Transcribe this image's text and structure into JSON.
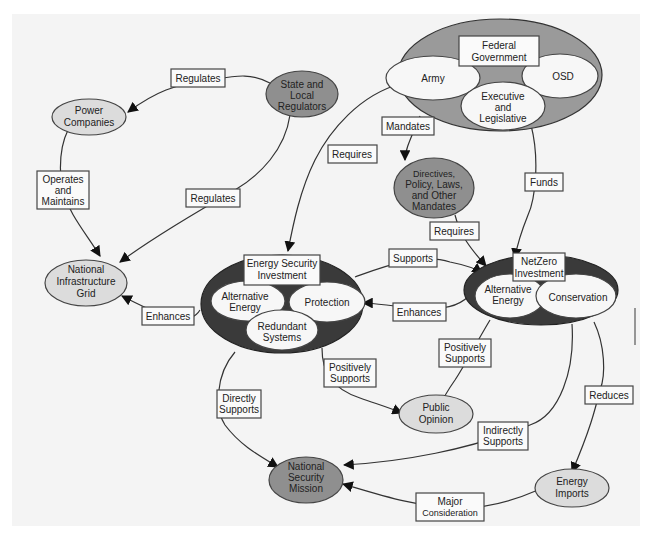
{
  "diagram": {
    "nodes": {
      "federal_government": {
        "title": [
          "Federal",
          "Government"
        ],
        "parts": {
          "army": "Army",
          "osd": "OSD",
          "exec": [
            "Executive",
            "and",
            "Legislative"
          ]
        }
      },
      "state_local_regulators": [
        "State and",
        "Local",
        "Regulators"
      ],
      "power_companies": [
        "Power",
        "Companies"
      ],
      "directives": [
        "Directives,",
        "Policy, Laws,",
        "and Other",
        "Mandates"
      ],
      "national_infrastructure_grid": [
        "National",
        "Infrastructure",
        "Grid"
      ],
      "energy_security_investment": {
        "title": [
          "Energy Security",
          "Investment"
        ],
        "parts": {
          "alt_energy": [
            "Alternative",
            "Energy"
          ],
          "protection": "Protection",
          "redundant": [
            "Redundant",
            "Systems"
          ]
        }
      },
      "netzero_investment": {
        "title": [
          "NetZero",
          "Investment"
        ],
        "parts": {
          "alt_energy": [
            "Alternative",
            "Energy"
          ],
          "conservation": "Conservation"
        }
      },
      "public_opinion": [
        "Public",
        "Opinion"
      ],
      "national_security_mission": [
        "National",
        "Security",
        "Mission"
      ],
      "energy_imports": [
        "Energy",
        "Imports"
      ]
    },
    "edges": {
      "regulates_top": "Regulates",
      "operates_maintains": [
        "Operates",
        "and",
        "Maintains"
      ],
      "regulates_mid": "Regulates",
      "requires_left": "Requires",
      "mandates": "Mandates",
      "funds": "Funds",
      "requires_mid": "Requires",
      "supports": "Supports",
      "enhances_right": "Enhances",
      "enhances_left": "Enhances",
      "positively_supports_left": [
        "Positively",
        "Supports"
      ],
      "positively_supports_right": [
        "Positively",
        "Supports"
      ],
      "directly_supports": [
        "Directly",
        "Supports"
      ],
      "reduces": "Reduces",
      "indirectly_supports": [
        "Indirectly",
        "Supports"
      ],
      "major_consideration": [
        "Major",
        "Consideration"
      ]
    }
  }
}
